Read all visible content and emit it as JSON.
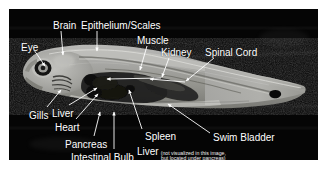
{
  "figure": {
    "kind": "annotated-anatomical-section",
    "background_color": "#ffffff",
    "frame_color": "#050505",
    "label_color": "#ffffff",
    "leader_color": "#ffffff"
  },
  "labels": [
    {
      "id": "eye",
      "text": "Eye",
      "x": 12,
      "y": 33
    },
    {
      "id": "brain",
      "text": "Brain",
      "x": 44,
      "y": 11
    },
    {
      "id": "epithelium",
      "text": "Epithelium/Scales",
      "x": 72,
      "y": 11
    },
    {
      "id": "muscle",
      "text": "Muscle",
      "x": 128,
      "y": 26
    },
    {
      "id": "kidney",
      "text": "Kidney",
      "x": 152,
      "y": 38
    },
    {
      "id": "spinal-cord",
      "text": "Spinal Cord",
      "x": 196,
      "y": 38
    },
    {
      "id": "gills",
      "text": "Gills",
      "x": 20,
      "y": 101
    },
    {
      "id": "liver",
      "text": "Liver",
      "x": 43,
      "y": 99
    },
    {
      "id": "heart",
      "text": "Heart",
      "x": 46,
      "y": 113
    },
    {
      "id": "pancreas",
      "text": "Pancreas",
      "x": 56,
      "y": 130
    },
    {
      "id": "intestinal-bulb",
      "text": "Intestinal Bulb",
      "x": 62,
      "y": 143
    },
    {
      "id": "spleen",
      "text": "Spleen",
      "x": 136,
      "y": 122
    },
    {
      "id": "swim-bladder",
      "text": "Swim Bladder",
      "x": 204,
      "y": 123
    }
  ],
  "note": {
    "id": "liver-note",
    "main_text": "Liver",
    "sub_line_1": "(not visualized in this image,",
    "sub_line_2": "but located under pancreas)",
    "x": 128,
    "y": 137
  },
  "leaders": [
    {
      "id": "leader-eye",
      "points": "25,41 36,57"
    },
    {
      "id": "leader-brain",
      "points": "52,22 54,46"
    },
    {
      "id": "leader-epithelium",
      "points": "88,22 88,42"
    },
    {
      "id": "leader-muscle",
      "points": "138,37 131,61"
    },
    {
      "id": "leader-kidney",
      "points": "160,49 153,69"
    },
    {
      "id": "leader-spinal-cord",
      "points": "205,49 176,72"
    },
    {
      "id": "leader-kidney-left",
      "points": "153,69 98,70"
    },
    {
      "id": "leader-spinal-left",
      "points": "176,72 141,70"
    },
    {
      "id": "leader-gills",
      "points": "38,98 52,81"
    },
    {
      "id": "leader-liver",
      "points": "60,96 88,79"
    },
    {
      "id": "leader-heart",
      "points": "67,110 89,85"
    },
    {
      "id": "leader-pancreas",
      "points": "85,127 91,103"
    },
    {
      "id": "leader-intestinal",
      "points": "105,140 105,103"
    },
    {
      "id": "leader-spleen",
      "points": "133,120 120,81"
    },
    {
      "id": "leader-swim-bladder",
      "points": "201,124 159,95"
    }
  ]
}
